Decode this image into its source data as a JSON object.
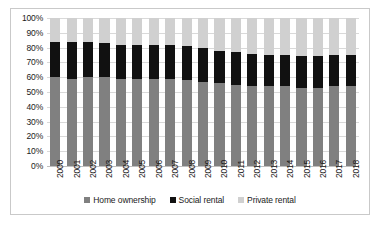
{
  "chart_data": {
    "type": "bar",
    "stacked": true,
    "title": "",
    "subtitle": "",
    "xlabel": "",
    "ylabel": "",
    "ylim": [
      0,
      100
    ],
    "ytick_labels": [
      "100%",
      "90%",
      "80%",
      "70%",
      "60%",
      "50%",
      "40%",
      "30%",
      "20%",
      "10%",
      "0%"
    ],
    "ytick_values": [
      100,
      90,
      80,
      70,
      60,
      50,
      40,
      30,
      20,
      10,
      0
    ],
    "grid": true,
    "legend_position": "bottom",
    "categories": [
      "2000",
      "2001",
      "2002",
      "2003",
      "2004",
      "2005",
      "2006",
      "2007",
      "2008",
      "2009",
      "2010",
      "2011",
      "2012",
      "2013",
      "2014",
      "2015",
      "2016",
      "2017",
      "2018"
    ],
    "series": [
      {
        "name": "Home ownership",
        "color": "#808080",
        "values": [
          60,
          59,
          60,
          60,
          59,
          59,
          59,
          59,
          58,
          57,
          56,
          55,
          54,
          54,
          54,
          53,
          53,
          54,
          54
        ]
      },
      {
        "name": "Social rental",
        "color": "#111111",
        "values": [
          24,
          25,
          24,
          23,
          23,
          23,
          23,
          23,
          23,
          23,
          22,
          22,
          22,
          21,
          21,
          21,
          21,
          21,
          21
        ]
      },
      {
        "name": "Private rental",
        "color": "#d0d0d0",
        "values": [
          16,
          16,
          16,
          17,
          18,
          18,
          18,
          18,
          19,
          20,
          22,
          23,
          24,
          25,
          25,
          26,
          26,
          25,
          25
        ]
      }
    ]
  },
  "legend": {
    "items": [
      {
        "label": "Home ownership",
        "color": "#808080"
      },
      {
        "label": "Social rental",
        "color": "#111111"
      },
      {
        "label": "Private rental",
        "color": "#d0d0d0"
      }
    ]
  }
}
